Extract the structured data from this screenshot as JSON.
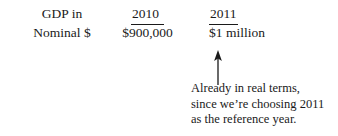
{
  "figure": {
    "table": {
      "row_label": {
        "line1": "GDP in",
        "line2": "Nominal $"
      },
      "columns": [
        {
          "header": "2010",
          "value": "$900,000"
        },
        {
          "header": "2011",
          "value": "$1 million"
        }
      ]
    },
    "callout": {
      "arrow": "up-arrow-icon",
      "lines": [
        "Already in real terms,",
        "since we’re choosing 2011",
        "as the reference year."
      ]
    },
    "colors": {
      "text": "#1a1a1a",
      "background": "#ffffff"
    }
  }
}
